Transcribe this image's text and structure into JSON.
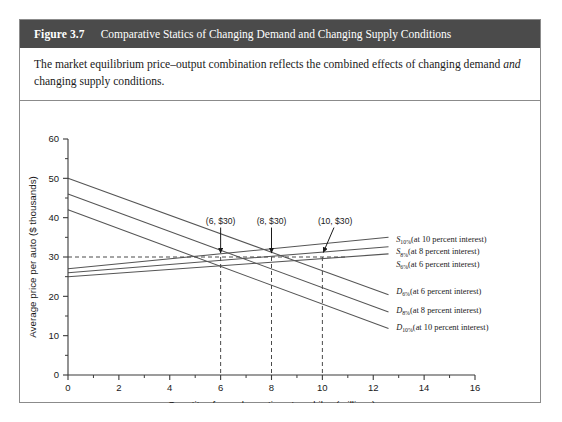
{
  "figure": {
    "number": "Figure 3.7",
    "title": "Comparative Statics of Changing Demand and Changing Supply Conditions",
    "caption_part1": "The market equilibrium price–output combination reflects the combined effects of changing demand ",
    "caption_italic": "and",
    "caption_part2": " changing supply conditions.",
    "header_bg": "#4b4b4b",
    "header_fg": "#ffffff",
    "border_color": "#8b8b8b"
  },
  "chart_data": {
    "type": "line",
    "title": "",
    "xlabel": "Quantity of new domestic automobiles (millions)",
    "ylabel": "Average price per auto ($ thousands)",
    "xlim": [
      0,
      16
    ],
    "ylim": [
      0,
      60
    ],
    "xticks": [
      0,
      2,
      4,
      6,
      8,
      10,
      12,
      14,
      16
    ],
    "xticklabels": [
      "0",
      "2",
      "4",
      "6",
      "8",
      "10",
      "12",
      "14",
      "16"
    ],
    "xminorticks": [
      1,
      3,
      5,
      7,
      9,
      11,
      13,
      15
    ],
    "yticks": [
      0,
      10,
      20,
      30,
      40,
      50,
      60
    ],
    "yticklabels": [
      "0",
      "10",
      "20",
      "30",
      "40",
      "50",
      "60"
    ],
    "yminorticks": [
      5,
      15,
      25,
      35,
      45,
      55
    ],
    "grid": false,
    "legend": "inline-right",
    "series": [
      {
        "name": "D6",
        "label_main": "D",
        "label_sub": "6%",
        "label_rest": "(at 6 percent interest)",
        "kind": "demand",
        "color": "#555555",
        "points": [
          [
            0,
            50
          ],
          [
            12.6,
            20.4
          ]
        ],
        "label_at": [
          12.9,
          21.3
        ]
      },
      {
        "name": "D8",
        "label_main": "D",
        "label_sub": "8%",
        "label_rest": "(at 8 percent interest)",
        "kind": "demand",
        "color": "#555555",
        "points": [
          [
            0,
            46
          ],
          [
            12.6,
            16.0
          ]
        ],
        "label_at": [
          12.9,
          16.6
        ]
      },
      {
        "name": "D10",
        "label_main": "D",
        "label_sub": "10%",
        "label_rest": "(at 10 percent interest)",
        "kind": "demand",
        "color": "#555555",
        "points": [
          [
            0,
            42
          ],
          [
            12.6,
            11.8
          ]
        ],
        "label_at": [
          12.9,
          12.2
        ]
      },
      {
        "name": "S10",
        "label_main": "S",
        "label_sub": "10%",
        "label_rest": "(at 10 percent interest)",
        "kind": "supply",
        "color": "#555555",
        "points": [
          [
            0,
            27
          ],
          [
            12.6,
            35.0
          ]
        ],
        "label_at": [
          12.9,
          34.6
        ]
      },
      {
        "name": "S8",
        "label_main": "S",
        "label_sub": "8%",
        "label_rest": "(at 8 percent interest)",
        "kind": "supply",
        "color": "#555555",
        "points": [
          [
            0,
            26
          ],
          [
            12.6,
            32.6
          ]
        ],
        "label_at": [
          12.9,
          31.4
        ]
      },
      {
        "name": "S6",
        "label_main": "S",
        "label_sub": "6%",
        "label_rest": "(at 6 percent interest)",
        "kind": "supply",
        "color": "#555555",
        "points": [
          [
            0,
            25
          ],
          [
            12.6,
            30.8
          ]
        ],
        "label_at": [
          12.9,
          28.2
        ]
      }
    ],
    "equilibrium_price": 30,
    "equilibrium_line_style": "dashed",
    "annotations": [
      {
        "text": "(6, $30)",
        "x": 6,
        "y": 30,
        "label_x": 6.0,
        "label_y": 38.5,
        "leader": "vertical-arrow"
      },
      {
        "text": "(8, $30)",
        "x": 8,
        "y": 30,
        "label_x": 8.0,
        "label_y": 38.5,
        "leader": "vertical-arrow"
      },
      {
        "text": "(10, $30)",
        "x": 10,
        "y": 30,
        "label_x": 10.5,
        "label_y": 38.5,
        "leader": "diagonal-arrow"
      }
    ],
    "droplines": [
      6,
      8,
      10
    ]
  }
}
